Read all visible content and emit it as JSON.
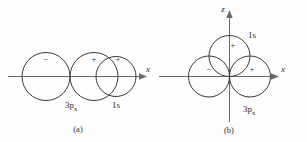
{
  "figure": {
    "background": "#fdfdfd",
    "stroke_color": "#3a3a3a",
    "axis_color": "#6a6a6a",
    "text_color": "#2b2b2b"
  },
  "panel_a": {
    "caption": "(a)",
    "axis_label_x": "x",
    "lobe_minus_sign": "−",
    "lobe_plus_sign": "+",
    "s_plus_sign": "+",
    "orbital_p_label": "3p",
    "orbital_p_subscript": "x",
    "orbital_s_label": "1s"
  },
  "panel_b": {
    "caption": "(b)",
    "axis_label_x": "x",
    "axis_label_z": "z",
    "lobe_minus_sign": "−",
    "lobe_plus_sign": "+",
    "s_plus_sign": "+",
    "orbital_p_label": "3p",
    "orbital_p_subscript": "x",
    "orbital_s_label": "1s"
  }
}
